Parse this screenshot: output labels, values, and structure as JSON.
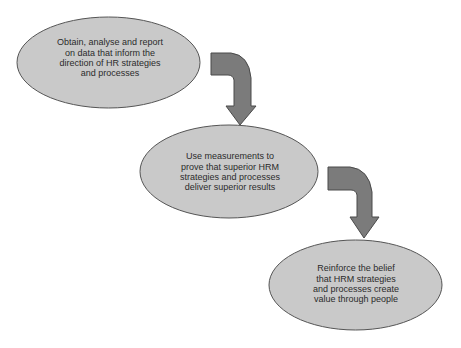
{
  "diagram": {
    "type": "flow",
    "colors": {
      "ellipse_fill": "#c9c9c9",
      "ellipse_stroke": "#555555",
      "arrow_fill": "#7b7b7b",
      "arrow_stroke": "#4a4a4a",
      "text": "#2b2b2b"
    },
    "nodes": [
      {
        "id": "step-1",
        "text": "Obtain, analyse and report\non data that inform the\ndirection of HR strategies\nand processes"
      },
      {
        "id": "step-2",
        "text": "Use measurements to\nprove that superior HRM\nstrategies and processes\ndeliver superior results"
      },
      {
        "id": "step-3",
        "text": "Reinforce the belief\nthat HRM strategies\nand processes create\nvalue through people"
      }
    ],
    "edges": [
      {
        "from": "step-1",
        "to": "step-2"
      },
      {
        "from": "step-2",
        "to": "step-3"
      }
    ]
  }
}
